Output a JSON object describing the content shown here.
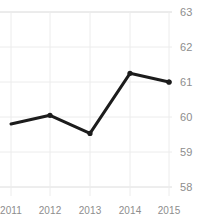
{
  "chart_data": {
    "type": "line",
    "title": "Female Smokers",
    "categories": [
      "2011",
      "2012",
      "2013",
      "2014",
      "2015"
    ],
    "x": [
      2011,
      2012,
      2013,
      2014,
      2015
    ],
    "values": [
      59.8,
      60.05,
      59.53,
      61.25,
      61.0
    ],
    "series": [
      {
        "name": "Value",
        "values": [
          59.8,
          60.05,
          59.53,
          61.25,
          61.0
        ]
      }
    ],
    "xlabel": "",
    "ylabel": "",
    "ylim": [
      58,
      63
    ],
    "yticks": [
      63,
      62,
      61,
      60,
      59,
      58
    ],
    "ytick_labels": [
      "63",
      "62",
      "61",
      "60",
      "59",
      "58"
    ],
    "xtick_labels": [
      "2011",
      "2012",
      "2013",
      "2014",
      "2015"
    ],
    "grid": true,
    "legend": false,
    "legend_position": "none",
    "line_color": "#1c1c1c",
    "marker": "circle",
    "marker_color": "#1c1c1c",
    "grid_color": "#e6e6e6",
    "tick_label_color": "#8d8d8d",
    "background_color": "#ffffff"
  }
}
